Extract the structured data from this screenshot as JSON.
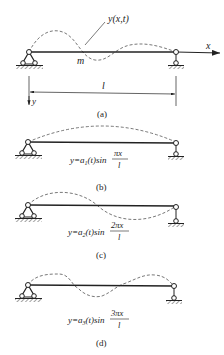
{
  "panel_a": {
    "curve_label": "y(x,t)",
    "mass_label": "m",
    "x_axis_label": "x",
    "y_axis_label": "y",
    "length_label": "l",
    "caption": "(a)"
  },
  "panel_b": {
    "formula_lhs": "y=a",
    "formula_sub": "1",
    "formula_mid": "(t)sin",
    "formula_num": "πx",
    "formula_den": "l",
    "caption": "(b)"
  },
  "panel_c": {
    "formula_lhs": "y=a",
    "formula_sub": "2",
    "formula_mid": "(t)sin",
    "formula_num": "2πx",
    "formula_den": "l",
    "caption": "(c)"
  },
  "panel_d": {
    "formula_lhs": "y=a",
    "formula_sub": "3",
    "formula_mid": "(t)sin",
    "formula_num": "3πx",
    "formula_den": "l",
    "caption": "(d)"
  },
  "colors": {
    "line": "#222222",
    "dashed": "#555555",
    "hatch": "#444444"
  }
}
